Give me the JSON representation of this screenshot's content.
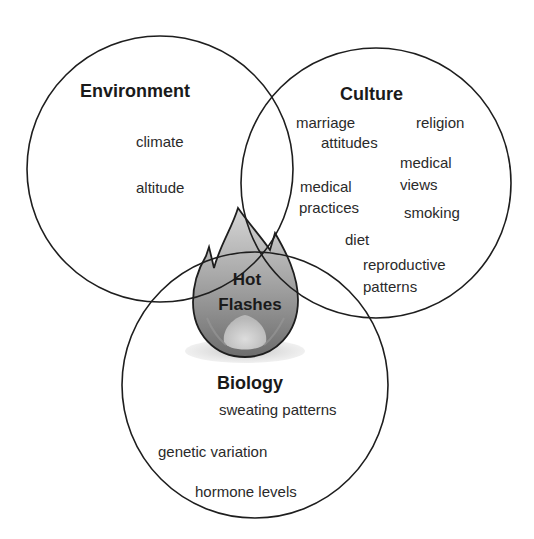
{
  "diagram": {
    "type": "venn",
    "center": {
      "icon": "flame-icon",
      "line1": "Hot",
      "line2": "Flashes"
    },
    "sets": {
      "environment": {
        "title": "Environment",
        "items": [
          "climate",
          "altitude"
        ]
      },
      "culture": {
        "title": "Culture",
        "items": [
          "marriage",
          "attitudes",
          "religion",
          "medical",
          "views",
          "medical",
          "practices",
          "smoking",
          "diet",
          "reproductive",
          "patterns"
        ]
      },
      "biology": {
        "title": "Biology",
        "items": [
          "sweating patterns",
          "genetic variation",
          "hormone levels"
        ]
      }
    }
  }
}
